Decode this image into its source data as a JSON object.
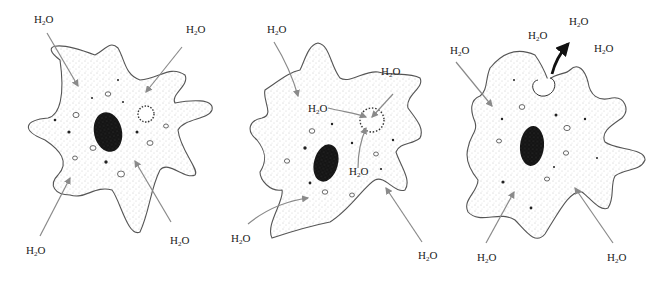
{
  "colors": {
    "outline": "#555555",
    "nucleus": "#1a1a1a",
    "arrow_in": "#8a8a8a",
    "arrow_out": "#111111",
    "stipple": "#9a9a9a"
  },
  "panels": [
    {
      "stage": "vacuole-filling",
      "labels": [
        {
          "text": "H",
          "sub": "2",
          "tail": "O",
          "x": 34,
          "y": 14
        },
        {
          "text": "H",
          "sub": "2",
          "tail": "O",
          "x": 186,
          "y": 24
        },
        {
          "text": "H",
          "sub": "2",
          "tail": "O",
          "x": 26,
          "y": 245
        },
        {
          "text": "H",
          "sub": "2",
          "tail": "O",
          "x": 170,
          "y": 235
        }
      ]
    },
    {
      "stage": "vacuole-collecting",
      "labels": [
        {
          "text": "H",
          "sub": "2",
          "tail": "O",
          "x": 267,
          "y": 24
        },
        {
          "text": "H",
          "sub": "2",
          "tail": "O",
          "x": 381,
          "y": 66
        },
        {
          "text": "H",
          "sub": "2",
          "tail": "O",
          "x": 308,
          "y": 103
        },
        {
          "text": "H",
          "sub": "2",
          "tail": "O",
          "x": 349,
          "y": 166
        },
        {
          "text": "H",
          "sub": "2",
          "tail": "O",
          "x": 231,
          "y": 233
        },
        {
          "text": "H",
          "sub": "2",
          "tail": "O",
          "x": 418,
          "y": 250
        }
      ]
    },
    {
      "stage": "vacuole-expelling",
      "labels": [
        {
          "text": "H",
          "sub": "2",
          "tail": "O",
          "x": 569,
          "y": 16
        },
        {
          "text": "H",
          "sub": "2",
          "tail": "O",
          "x": 528,
          "y": 30
        },
        {
          "text": "H",
          "sub": "2",
          "tail": "O",
          "x": 594,
          "y": 43
        },
        {
          "text": "H",
          "sub": "2",
          "tail": "O",
          "x": 450,
          "y": 45
        },
        {
          "text": "H",
          "sub": "2",
          "tail": "O",
          "x": 477,
          "y": 252
        },
        {
          "text": "H",
          "sub": "2",
          "tail": "O",
          "x": 607,
          "y": 252
        }
      ]
    }
  ]
}
